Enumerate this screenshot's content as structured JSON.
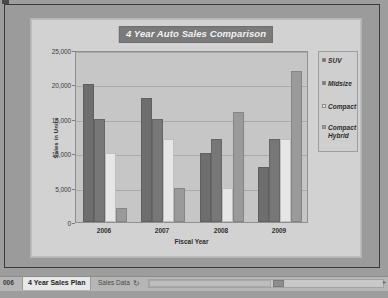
{
  "chart_data": {
    "type": "bar",
    "title": "4 Year Auto Sales Comparison",
    "xlabel": "Fiscal Year",
    "ylabel": "Sales in Units",
    "categories": [
      "2006",
      "2007",
      "2008",
      "2009"
    ],
    "ylim": [
      0,
      25000
    ],
    "yticks": [
      0,
      5000,
      10000,
      15000,
      20000,
      25000
    ],
    "ytick_labels": [
      "0",
      "5,000",
      "10,000",
      "15,000",
      "20,000",
      "25,000"
    ],
    "grid": true,
    "legend_position": "right",
    "series": [
      {
        "name": "SUV",
        "color": "#6e6e6e",
        "values": [
          20000,
          18000,
          10000,
          8000
        ]
      },
      {
        "name": "Midsize",
        "color": "#777777",
        "values": [
          15000,
          15000,
          12000,
          12000
        ]
      },
      {
        "name": "Compact",
        "color": "#e6e6e6",
        "values": [
          10000,
          12000,
          5000,
          12000
        ]
      },
      {
        "name": "Compact Hybrid",
        "color": "#9a9a9a",
        "values": [
          2000,
          5000,
          16000,
          22000
        ]
      }
    ]
  },
  "legend": {
    "items": [
      {
        "label": "SUV"
      },
      {
        "label": "Midsize"
      },
      {
        "label": "Compact"
      },
      {
        "label": "Compact Hybrid"
      }
    ]
  },
  "sheet_bar": {
    "partial_tab": "006",
    "active_tab": "4 Year Sales Plan",
    "inactive_tab": "Sales Data",
    "new_sheet_icon": "new-sheet-icon",
    "scroll_right_icon": "▸"
  }
}
